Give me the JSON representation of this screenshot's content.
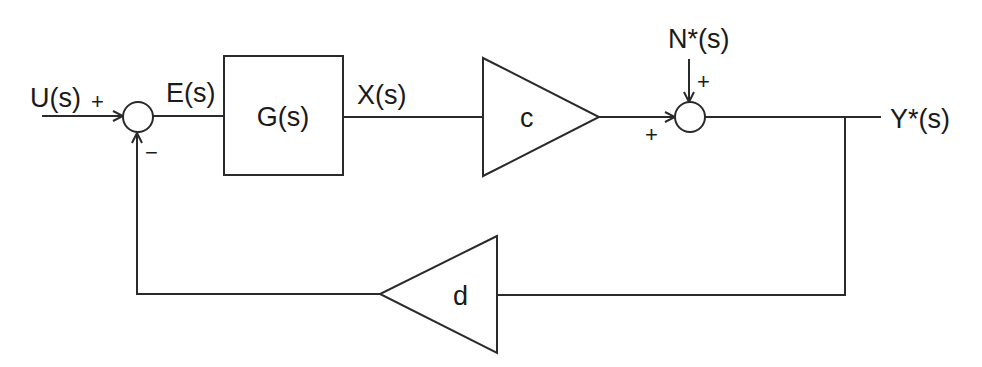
{
  "diagram": {
    "type": "feedback-control-block-diagram",
    "signals": {
      "input": "U(s)",
      "error": "E(s)",
      "plant_output": "X(s)",
      "noise": "N*(s)",
      "output": "Y*(s)"
    },
    "blocks": {
      "plant": "G(s)",
      "forward_gain": "c",
      "feedback_gain": "d"
    },
    "junction1_signs": {
      "input": "+",
      "feedback": "−"
    },
    "junction2_signs": {
      "forward": "+",
      "noise": "+"
    },
    "colors": {
      "line": "#2a2a2a",
      "text": "#1a1a1a",
      "background": "#ffffff"
    }
  }
}
